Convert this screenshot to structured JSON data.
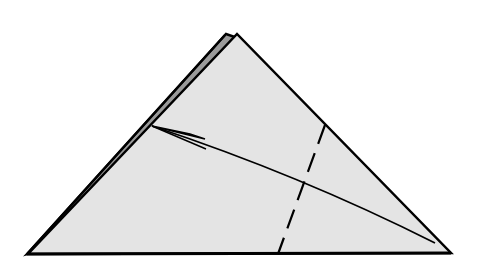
{
  "diagram": {
    "type": "origami-fold-step",
    "colors": {
      "background": "#ffffff",
      "paper_front": "#e4e4e4",
      "paper_back_layer": "#9a9a9a",
      "outline": "#000000"
    },
    "shapes": {
      "front_triangle": [
        [
          28,
          254
        ],
        [
          237,
          35
        ],
        [
          450,
          252
        ]
      ],
      "back_layer_triangle": [
        [
          28,
          254
        ],
        [
          226,
          35
        ],
        [
          237,
          35
        ]
      ],
      "valley_fold_line": {
        "from": [
          325,
          125
        ],
        "to": [
          278,
          253
        ],
        "style": "dashed"
      },
      "fold_arrow": {
        "from": [
          435,
          243
        ],
        "to": [
          152,
          126
        ],
        "head": "half-arrowhead"
      }
    }
  }
}
